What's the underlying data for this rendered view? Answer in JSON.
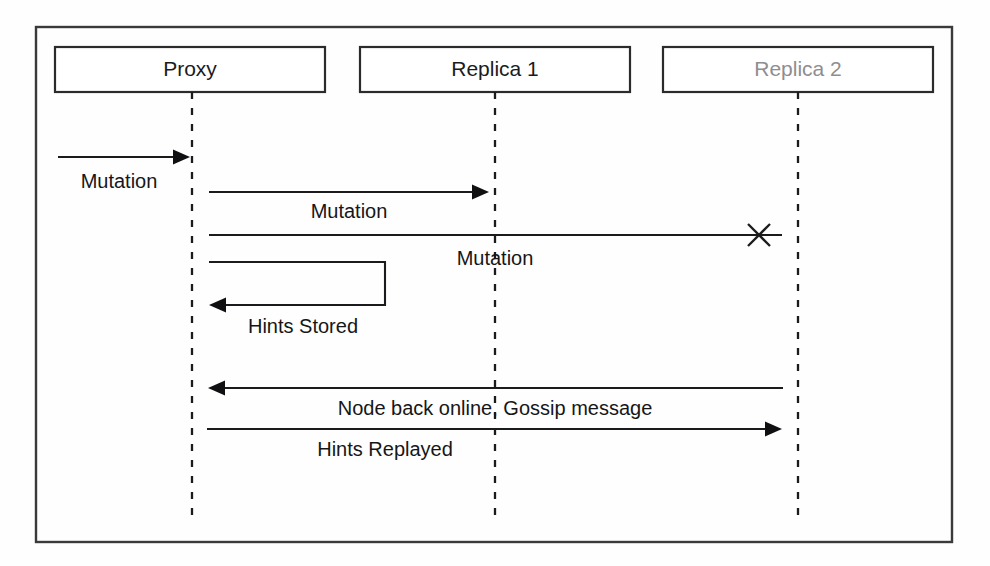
{
  "diagram": {
    "type": "sequence-diagram",
    "background_color": "#fefefe",
    "line_color": "#1b1b1d",
    "frame": {
      "x": 36,
      "y": 27,
      "width": 916,
      "height": 515
    },
    "actors": [
      {
        "id": "proxy",
        "label": "Proxy",
        "state": "active",
        "text_color": "#1b1b1d",
        "box": {
          "x": 55,
          "y": 47,
          "width": 270,
          "height": 45
        },
        "lifeline_x": 192,
        "lifeline_top": 92,
        "lifeline_bottom": 520
      },
      {
        "id": "replica-1",
        "label": "Replica 1",
        "state": "active",
        "text_color": "#1b1b1d",
        "box": {
          "x": 360,
          "y": 47,
          "width": 270,
          "height": 45
        },
        "lifeline_x": 495,
        "lifeline_top": 92,
        "lifeline_bottom": 520
      },
      {
        "id": "replica-2",
        "label": "Replica 2",
        "state": "offline",
        "text_color": "#8e8e90",
        "box": {
          "x": 663,
          "y": 47,
          "width": 270,
          "height": 45
        },
        "lifeline_x": 798,
        "lifeline_top": 92,
        "lifeline_bottom": 520
      }
    ],
    "messages": [
      {
        "id": "m1",
        "label": "Mutation",
        "from": "external",
        "to": "proxy",
        "direction": "right",
        "kind": "arrow",
        "x1": 58,
        "x2": 190,
        "y": 157,
        "label_x": 119,
        "label_y": 183
      },
      {
        "id": "m2",
        "label": "Mutation",
        "from": "proxy",
        "to": "replica-1",
        "direction": "right",
        "kind": "arrow",
        "x1": 209,
        "x2": 489,
        "y": 192,
        "label_x": 349,
        "label_y": 213
      },
      {
        "id": "m3",
        "label": "Mutation",
        "from": "proxy",
        "to": "replica-2",
        "direction": "right",
        "kind": "failed",
        "x1": 209,
        "x2": 782,
        "y": 235,
        "fail_x": 759,
        "fail_y": 235,
        "label_x": 495,
        "label_y": 260
      },
      {
        "id": "m4",
        "label": "Hints Stored",
        "from": "proxy",
        "to": "proxy",
        "direction": "self",
        "kind": "self-loop",
        "x1": 209,
        "x2": 385,
        "y_top": 262,
        "y_bottom": 305,
        "label_x": 303,
        "label_y": 328
      },
      {
        "id": "m5",
        "label": "Node back online, Gossip message",
        "from": "replica-2",
        "to": "proxy",
        "direction": "left",
        "kind": "arrow",
        "x1": 783,
        "x2": 208,
        "y": 388,
        "label_x": 495,
        "label_y": 410
      },
      {
        "id": "m6",
        "label": "Hints Replayed",
        "from": "proxy",
        "to": "replica-2",
        "direction": "right",
        "kind": "arrow",
        "x1": 207,
        "x2": 782,
        "y": 429,
        "label_x": 385,
        "label_y": 451
      }
    ]
  }
}
